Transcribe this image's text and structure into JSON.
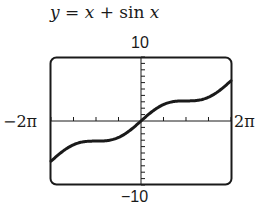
{
  "chart_data": {
    "type": "line",
    "title": "y = x + sin x",
    "function": "x + sin(x)",
    "xlabel": "",
    "ylabel": "",
    "xlim": [
      -6.2832,
      6.2832
    ],
    "ylim": [
      -10,
      10
    ],
    "xlim_labels": [
      "-2π",
      "2π"
    ],
    "ylim_labels": [
      "10",
      "-10"
    ],
    "x_tick_spacing": "π/2",
    "y_tick_spacing": 1,
    "grid": false,
    "legend": null,
    "series": [
      {
        "name": "y = x + sin x",
        "x": [
          -6.2832,
          -5.4978,
          -4.7124,
          -3.927,
          -3.1416,
          -2.3562,
          -1.5708,
          -0.7854,
          0,
          0.7854,
          1.5708,
          2.3562,
          3.1416,
          3.927,
          4.7124,
          5.4978,
          6.2832
        ],
        "values": [
          -6.28,
          -4.79,
          -3.71,
          -3.22,
          -3.14,
          -3.06,
          -2.57,
          -1.49,
          0,
          1.49,
          2.57,
          3.06,
          3.14,
          3.22,
          3.71,
          4.79,
          6.28
        ]
      }
    ]
  },
  "labels": {
    "title_y": "y",
    "title_eq": " = ",
    "title_x": "x",
    "title_plus": " + sin ",
    "title_x2": "x",
    "ymax": "10",
    "ymin": "−10",
    "xmin": "−2π",
    "xmax": "2π"
  },
  "style": {
    "line_color": "#1a1a1a",
    "frame_color": "#1a1a1a"
  }
}
